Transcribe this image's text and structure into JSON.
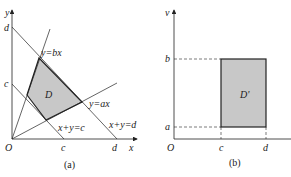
{
  "panel_a": {
    "caption": "(a)",
    "origin_label": "O",
    "x_axis_label": "x",
    "y_axis_label": "y",
    "x_ticks": [
      "c",
      "d"
    ],
    "y_ticks": [
      "d",
      "c"
    ],
    "region_label": "D",
    "line_labels": {
      "bx": "y=bx",
      "ax": "y=ax",
      "c": "x+y=c",
      "d": "x+y=d"
    }
  },
  "panel_b": {
    "caption": "(b)",
    "origin_label": "O",
    "v_axis_label": "v",
    "u_ticks": [
      "c",
      "d"
    ],
    "v_ticks": [
      "b",
      "a"
    ],
    "region_label": "D'"
  },
  "colors": {
    "line": "#222222",
    "fill": "#c8c8c8"
  }
}
